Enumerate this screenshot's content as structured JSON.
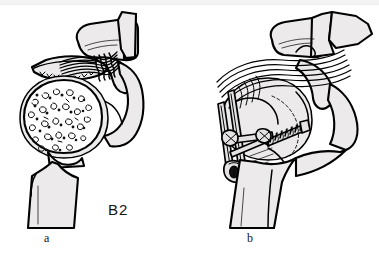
{
  "figure": {
    "classification_label": "B2",
    "background_color": "#ffffff",
    "ink_color": "#000000",
    "bone_fill_color": "#eceaea",
    "panels": [
      {
        "id": "a",
        "caption": "a",
        "description": "Displaced proximal humerus fracture with avulsed greater tuberosity and exposed cancellous humeral head",
        "structures": [
          "acromion",
          "coracoid-process",
          "glenoid",
          "avulsed-greater-tuberosity",
          "rotator-cuff-tendon",
          "humeral-head-cancellous-bone",
          "humeral-shaft",
          "fracture-gap"
        ]
      },
      {
        "id": "b",
        "caption": "b",
        "description": "Operative repair with cancellous lag screw and figure-of-eight tension band wire, rotator cuff reattached",
        "structures": [
          "acromion",
          "coracoid-process",
          "reduced-greater-tuberosity",
          "rotator-cuff-tendon-sutures",
          "cancellous-lag-screw",
          "tension-band-wire",
          "wire-knot-proximal",
          "wire-knot-distal",
          "humeral-head",
          "humeral-shaft"
        ]
      }
    ]
  }
}
